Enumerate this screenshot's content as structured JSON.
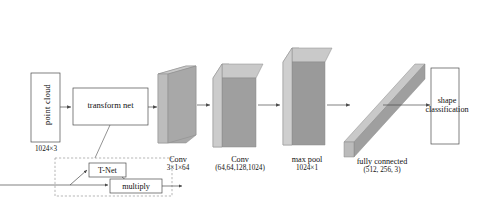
{
  "figure": {
    "background": "#ffffff",
    "line_color": "#4a4a4a",
    "block_front": "#a8a8a8",
    "block_light": "#c9c9c9",
    "block_dark": "#8f8f8f",
    "dashed_border": "#9a9a9a"
  },
  "input": {
    "label": "point cloud",
    "dimension": "1024×3"
  },
  "transform_net": {
    "label": "transform net"
  },
  "tnet_group": {
    "tnet_label": "T-Net",
    "multiply_label": "multiply"
  },
  "blocks": [
    {
      "name": "conv1",
      "label_line1": "Conv",
      "label_line2": "3×1×64"
    },
    {
      "name": "conv2",
      "label_line1": "Conv",
      "label_line2": "(64,64,128,1024)"
    },
    {
      "name": "maxpool",
      "label_line1": "max pool",
      "label_line2": "1024×1"
    },
    {
      "name": "fully_connected",
      "label_line1": "fully connected",
      "label_line2": "(512, 256, 3)"
    }
  ],
  "output": {
    "label_line1": "shape",
    "label_line2": "classification"
  }
}
